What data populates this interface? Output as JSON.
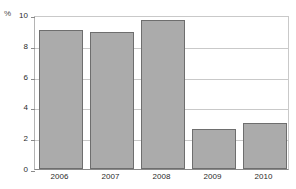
{
  "chart_data": {
    "type": "bar",
    "title": "",
    "xlabel": "",
    "ylabel": "%",
    "categories": [
      "2006",
      "2007",
      "2008",
      "2009",
      "2010"
    ],
    "values": [
      9.0,
      8.9,
      9.7,
      2.6,
      3.0
    ],
    "ylim": [
      0,
      10
    ],
    "yticks": [
      0,
      2,
      4,
      6,
      8,
      10
    ],
    "ytick_labels": [
      "0",
      "2",
      "4",
      "6",
      "8",
      "10"
    ],
    "grid": true,
    "legend": false,
    "legend_position": "none",
    "bar_color": "#ababab",
    "bar_edge_color": "#6e6e6e",
    "grid_color": "#c9c9c9",
    "axis_color": "#8a8a8a",
    "background_color": "#ffffff",
    "text_color": "#2b2b2b"
  }
}
